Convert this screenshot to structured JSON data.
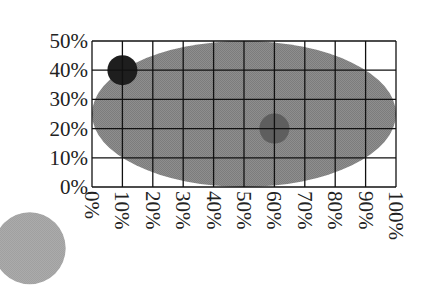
{
  "chart_data": {
    "type": "scatter",
    "title": "",
    "xlabel": "",
    "ylabel": "",
    "xlim": [
      0,
      100
    ],
    "ylim": [
      0,
      50
    ],
    "grid": true,
    "legend": null,
    "x_ticks": [
      "0%",
      "10%",
      "20%",
      "30%",
      "40%",
      "50%",
      "60%",
      "70%",
      "80%",
      "90%",
      "100%"
    ],
    "y_ticks": [
      "0%",
      "10%",
      "20%",
      "30%",
      "40%",
      "50%"
    ],
    "x_tick_rotation": 90,
    "shapes": [
      {
        "kind": "ellipse",
        "name": "large-ellipse",
        "cx": 50,
        "cy": 25,
        "rx": 50,
        "ry": 25,
        "color": "#8a8a8a",
        "texture": "dithered"
      },
      {
        "kind": "circle",
        "name": "dark-point",
        "x": 10,
        "y": 40,
        "radius_px": 15,
        "color": "#1e1e1e"
      },
      {
        "kind": "circle",
        "name": "medium-point",
        "x": 60,
        "y": 20,
        "radius_px": 15,
        "color": "#5e5e5e"
      },
      {
        "kind": "circle",
        "name": "light-point-outside",
        "x": -20.5,
        "y": -21.0,
        "radius_px": 36,
        "color": "#a9a9a9",
        "note": "drawn outside plot area, lower-left"
      }
    ]
  },
  "colors": {
    "grid_line": "#111111",
    "background": "#ffffff",
    "axis_text": "#222222"
  },
  "layout": {
    "plot_left": 92,
    "plot_top": 41,
    "plot_width": 304,
    "plot_height": 146
  }
}
